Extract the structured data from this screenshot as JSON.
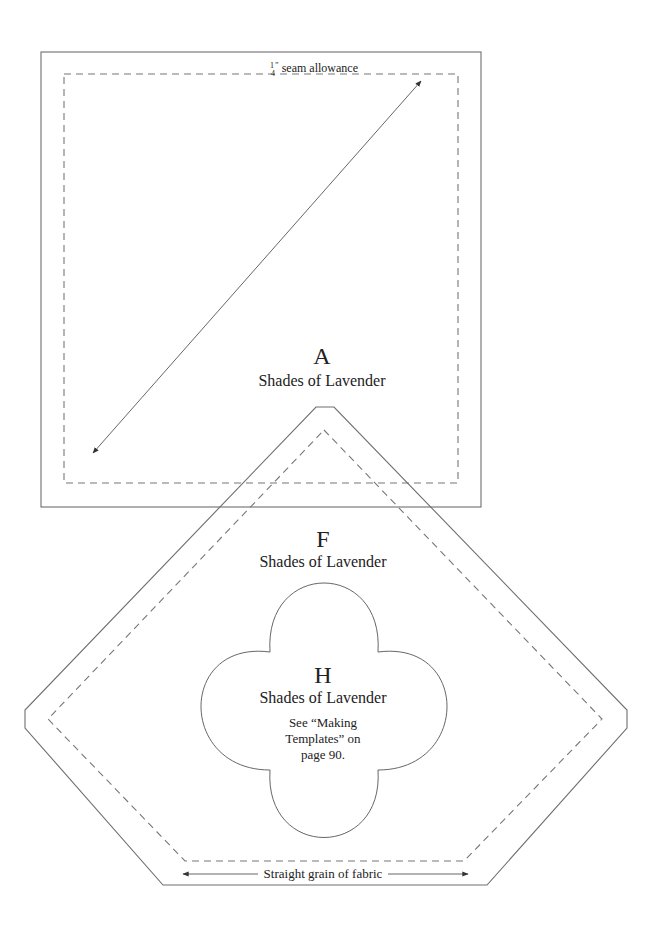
{
  "page": {
    "seam_allowance_label": "seam allowance",
    "seam_fraction_num": "1",
    "seam_fraction_den": "4",
    "seam_fraction_mark": "\""
  },
  "templates": {
    "A": {
      "letter": "A",
      "fabric": "Shades of Lavender"
    },
    "F": {
      "letter": "F",
      "fabric": "Shades of Lavender"
    },
    "H": {
      "letter": "H",
      "fabric": "Shades of Lavender",
      "note_lines": [
        "See “Making",
        "Templates” on",
        "page 90."
      ]
    }
  },
  "grain_label": "Straight grain of fabric",
  "colors": {
    "line": "#6e6e6e",
    "text": "#222222",
    "background": "#ffffff"
  }
}
